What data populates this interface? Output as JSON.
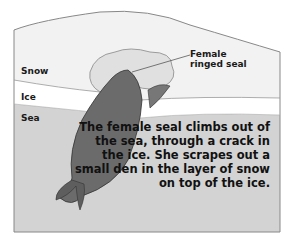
{
  "labels": {
    "snow": "Snow",
    "ice": "Ice",
    "sea": "Sea",
    "seal_line1": "Female",
    "seal_line2": "ringed seal"
  },
  "caption": "The female seal climbs out of the sea, through a crack in the ice. She scrapes out a small den in the layer of snow on top of the ice.",
  "colors": {
    "snow": "#f2f2f2",
    "ice": "#ffffff",
    "sea": "#d3d3d3",
    "seal": "#6b6b6b",
    "den": "#e0e0e0",
    "outline": "#888888"
  }
}
